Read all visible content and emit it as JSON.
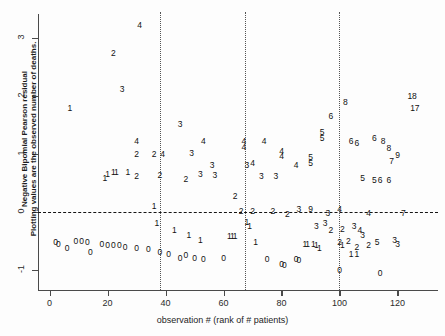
{
  "chart_data": {
    "type": "scatter",
    "title": "",
    "xlabel": "observation # (rank of # patients)",
    "ylabel_line1": "Negative Bipomial Pearson residual",
    "ylabel_line2": "Plotting values are the observed number of deaths.",
    "xlim": [
      -4,
      134
    ],
    "ylim": [
      -1.35,
      3.45
    ],
    "xticks": [
      0,
      20,
      40,
      60,
      80,
      100,
      120
    ],
    "xtick_labels": [
      "0",
      "20",
      "40",
      "60",
      "80",
      "100",
      "120"
    ],
    "yticks": [
      -1,
      0,
      1,
      2,
      3
    ],
    "ytick_labels": [
      "-1",
      "0",
      "1",
      "2",
      "3"
    ],
    "grid": false,
    "legend": "none",
    "reference_lines": {
      "horizontal": [
        0
      ],
      "vertical": [
        38,
        67.5,
        100
      ]
    },
    "marker_style": "text-label-is-observed-deaths",
    "points": [
      {
        "x": 7,
        "y": 1.8,
        "label": "1"
      },
      {
        "x": 22,
        "y": 2.75,
        "label": "2"
      },
      {
        "x": 25,
        "y": 2.12,
        "label": "3"
      },
      {
        "x": 31,
        "y": 3.22,
        "label": "4"
      },
      {
        "x": 30,
        "y": 1.22,
        "label": "4"
      },
      {
        "x": 30,
        "y": 1.0,
        "label": "2"
      },
      {
        "x": 20,
        "y": 0.66,
        "label": "1"
      },
      {
        "x": 19,
        "y": 0.58,
        "label": "1"
      },
      {
        "x": 22,
        "y": 0.69,
        "label": "1"
      },
      {
        "x": 23,
        "y": 0.68,
        "label": "1"
      },
      {
        "x": 27,
        "y": 0.69,
        "label": "1"
      },
      {
        "x": 30,
        "y": 0.62,
        "label": "2"
      },
      {
        "x": 36,
        "y": 1.0,
        "label": "2"
      },
      {
        "x": 39,
        "y": 1.0,
        "label": "4"
      },
      {
        "x": 38,
        "y": 0.63,
        "label": "2"
      },
      {
        "x": 36,
        "y": 0.1,
        "label": "1"
      },
      {
        "x": 45,
        "y": 1.52,
        "label": "3"
      },
      {
        "x": 53,
        "y": 1.23,
        "label": "4"
      },
      {
        "x": 49,
        "y": 1.02,
        "label": "3"
      },
      {
        "x": 56,
        "y": 0.8,
        "label": "3"
      },
      {
        "x": 52,
        "y": 0.65,
        "label": "3"
      },
      {
        "x": 57,
        "y": 0.63,
        "label": "3"
      },
      {
        "x": 47,
        "y": 0.56,
        "label": "2"
      },
      {
        "x": 64,
        "y": 0.28,
        "label": "2"
      },
      {
        "x": 67,
        "y": 1.22,
        "label": "4"
      },
      {
        "x": 67,
        "y": 1.12,
        "label": "4"
      },
      {
        "x": 68,
        "y": 0.8,
        "label": "3"
      },
      {
        "x": 70,
        "y": 0.84,
        "label": "4"
      },
      {
        "x": 74,
        "y": 1.22,
        "label": "4"
      },
      {
        "x": 80,
        "y": 1.05,
        "label": "4"
      },
      {
        "x": 80,
        "y": 0.96,
        "label": "4"
      },
      {
        "x": 85,
        "y": 0.8,
        "label": "4"
      },
      {
        "x": 73,
        "y": 0.62,
        "label": "3"
      },
      {
        "x": 78,
        "y": 0.62,
        "label": "3"
      },
      {
        "x": 90,
        "y": 0.94,
        "label": "5"
      },
      {
        "x": 90,
        "y": 0.84,
        "label": "5"
      },
      {
        "x": 66,
        "y": 0.02,
        "label": "2"
      },
      {
        "x": 70,
        "y": 0.02,
        "label": "2"
      },
      {
        "x": 77,
        "y": 0.02,
        "label": "2"
      },
      {
        "x": 82,
        "y": -0.03,
        "label": "2"
      },
      {
        "x": 86,
        "y": 0.05,
        "label": "3"
      },
      {
        "x": 96,
        "y": -0.02,
        "label": "3"
      },
      {
        "x": 97,
        "y": 1.65,
        "label": "6"
      },
      {
        "x": 102,
        "y": 1.9,
        "label": "8"
      },
      {
        "x": 104,
        "y": 1.22,
        "label": "6"
      },
      {
        "x": 106,
        "y": 1.18,
        "label": "6"
      },
      {
        "x": 112,
        "y": 1.28,
        "label": "6"
      },
      {
        "x": 115,
        "y": 1.22,
        "label": "8"
      },
      {
        "x": 117,
        "y": 1.1,
        "label": "8"
      },
      {
        "x": 120,
        "y": 0.98,
        "label": "9"
      },
      {
        "x": 118,
        "y": 0.88,
        "label": "7"
      },
      {
        "x": 108,
        "y": 0.58,
        "label": "5"
      },
      {
        "x": 112,
        "y": 0.55,
        "label": "5"
      },
      {
        "x": 114,
        "y": 0.55,
        "label": "6"
      },
      {
        "x": 117,
        "y": 0.55,
        "label": "6"
      },
      {
        "x": 125,
        "y": 2.0,
        "label": "18"
      },
      {
        "x": 126,
        "y": 1.8,
        "label": "17"
      },
      {
        "x": 100,
        "y": 0.05,
        "label": "4"
      },
      {
        "x": 110,
        "y": -0.02,
        "label": "4"
      },
      {
        "x": 122,
        "y": -0.02,
        "label": "7"
      },
      {
        "x": 94,
        "y": 1.38,
        "label": "5"
      },
      {
        "x": 94,
        "y": 1.28,
        "label": "5"
      },
      {
        "x": 90,
        "y": 0.05,
        "label": "9"
      },
      {
        "x": 95,
        "y": -0.2,
        "label": "3"
      },
      {
        "x": 92,
        "y": -0.25,
        "label": "3"
      },
      {
        "x": 97,
        "y": -0.32,
        "label": "2"
      },
      {
        "x": 101,
        "y": -0.3,
        "label": "2"
      },
      {
        "x": 105,
        "y": -0.25,
        "label": "3"
      },
      {
        "x": 107,
        "y": -0.32,
        "label": "4"
      },
      {
        "x": 108,
        "y": -0.4,
        "label": "3"
      },
      {
        "x": 100,
        "y": -0.52,
        "label": "2"
      },
      {
        "x": 103,
        "y": -0.5,
        "label": "2"
      },
      {
        "x": 101,
        "y": -0.58,
        "label": "1"
      },
      {
        "x": 113,
        "y": -0.52,
        "label": "5"
      },
      {
        "x": 119,
        "y": -0.48,
        "label": "3"
      },
      {
        "x": 120,
        "y": -0.55,
        "label": "3"
      },
      {
        "x": 110,
        "y": -0.58,
        "label": "2"
      },
      {
        "x": 106,
        "y": -0.6,
        "label": "2"
      },
      {
        "x": 104,
        "y": -0.72,
        "label": "1"
      },
      {
        "x": 106,
        "y": -0.72,
        "label": "1"
      },
      {
        "x": 88,
        "y": -0.55,
        "label": "1"
      },
      {
        "x": 89,
        "y": -0.56,
        "label": "1"
      },
      {
        "x": 91,
        "y": -0.56,
        "label": "1"
      },
      {
        "x": 92,
        "y": -0.57,
        "label": "1"
      },
      {
        "x": 93,
        "y": -0.63,
        "label": "1"
      },
      {
        "x": 85,
        "y": -0.82,
        "label": "0"
      },
      {
        "x": 86,
        "y": -0.84,
        "label": "0"
      },
      {
        "x": 100,
        "y": -1.0,
        "label": "0"
      },
      {
        "x": 114,
        "y": -1.05,
        "label": "0"
      },
      {
        "x": 68,
        "y": -0.18,
        "label": "1"
      },
      {
        "x": 69,
        "y": -0.25,
        "label": "1"
      },
      {
        "x": 62,
        "y": -0.42,
        "label": "1"
      },
      {
        "x": 63,
        "y": -0.42,
        "label": "1"
      },
      {
        "x": 64,
        "y": -0.42,
        "label": "1"
      },
      {
        "x": 71,
        "y": -0.52,
        "label": "1"
      },
      {
        "x": 48,
        "y": -0.4,
        "label": "1"
      },
      {
        "x": 52,
        "y": -0.48,
        "label": "1"
      },
      {
        "x": 43,
        "y": -0.32,
        "label": "1"
      },
      {
        "x": 37,
        "y": -0.2,
        "label": "1"
      },
      {
        "x": 75,
        "y": -0.82,
        "label": "0"
      },
      {
        "x": 80,
        "y": -0.9,
        "label": "0"
      },
      {
        "x": 81,
        "y": -0.92,
        "label": "0"
      },
      {
        "x": 60,
        "y": -0.8,
        "label": "0"
      },
      {
        "x": 53,
        "y": -0.82,
        "label": "0"
      },
      {
        "x": 50,
        "y": -0.8,
        "label": "0"
      },
      {
        "x": 47,
        "y": -0.75,
        "label": "0"
      },
      {
        "x": 45,
        "y": -0.8,
        "label": "0"
      },
      {
        "x": 41,
        "y": -0.72,
        "label": "0"
      },
      {
        "x": 38,
        "y": -0.7,
        "label": "0"
      },
      {
        "x": 34,
        "y": -0.65,
        "label": "0"
      },
      {
        "x": 30,
        "y": -0.62,
        "label": "0"
      },
      {
        "x": 26,
        "y": -0.6,
        "label": "0"
      },
      {
        "x": 24,
        "y": -0.58,
        "label": "0"
      },
      {
        "x": 22,
        "y": -0.57,
        "label": "0"
      },
      {
        "x": 20,
        "y": -0.57,
        "label": "0"
      },
      {
        "x": 18,
        "y": -0.56,
        "label": "0"
      },
      {
        "x": 13,
        "y": -0.52,
        "label": "0"
      },
      {
        "x": 11,
        "y": -0.5,
        "label": "0"
      },
      {
        "x": 9,
        "y": -0.5,
        "label": "0"
      },
      {
        "x": 14,
        "y": -0.7,
        "label": "0"
      },
      {
        "x": 6,
        "y": -0.62,
        "label": "0"
      },
      {
        "x": 3,
        "y": -0.55,
        "label": "0"
      },
      {
        "x": 2,
        "y": -0.52,
        "label": "0"
      }
    ]
  }
}
